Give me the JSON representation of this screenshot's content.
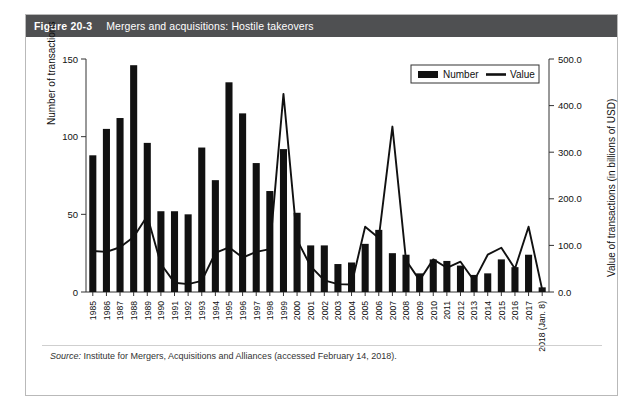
{
  "figure": {
    "number": "Figure 20-3",
    "title": "Mergers and acquisitions: Hostile takeovers"
  },
  "source": {
    "label": "Source:",
    "text": " Institute for Mergers, Acquisitions and Alliances (accessed February 14, 2018)."
  },
  "colors": {
    "title_bar_bg": "#4f5052",
    "title_bar_text": "#ffffff",
    "bar_fill": "#111111",
    "line_stroke": "#111111",
    "card_border": "#b9b9b9",
    "axis": "#333333"
  },
  "chart_data": {
    "type": "bar",
    "title": "Mergers and acquisitions: Hostile takeovers",
    "xlabel": "",
    "ylabel": "Number of transactions",
    "y2label": "Value of transactions (in billions of USD)",
    "ylim": [
      0,
      150
    ],
    "y2lim": [
      0,
      500
    ],
    "yticks": [
      0,
      50,
      100,
      150
    ],
    "y2ticks": [
      "0.0",
      "100.0",
      "200.0",
      "300.0",
      "400.0",
      "500.0"
    ],
    "grid": false,
    "legend_position": "top-right",
    "legend": [
      "Number",
      "Value"
    ],
    "categories": [
      "1985",
      "1986",
      "1987",
      "1988",
      "1989",
      "1990",
      "1991",
      "1992",
      "1993",
      "1994",
      "1995",
      "1996",
      "1997",
      "1998",
      "1999",
      "2000",
      "2001",
      "2002",
      "2003",
      "2004",
      "2005",
      "2006",
      "2007",
      "2008",
      "2009",
      "2010",
      "2011",
      "2012",
      "2013",
      "2014",
      "2015",
      "2016",
      "2017",
      "2018 (Jan. 8)"
    ],
    "series": [
      {
        "name": "Number",
        "type": "bar",
        "axis": "left",
        "values": [
          88,
          105,
          112,
          146,
          96,
          52,
          52,
          50,
          93,
          72,
          135,
          115,
          83,
          65,
          92,
          51,
          30,
          30,
          18,
          19,
          31,
          40,
          25,
          24,
          12,
          21,
          20,
          17,
          11,
          12,
          21,
          16,
          24,
          3
        ]
      },
      {
        "name": "Value",
        "type": "line",
        "axis": "right",
        "values": [
          88,
          86,
          96,
          118,
          163,
          60,
          20,
          17,
          24,
          84,
          96,
          74,
          86,
          92,
          425,
          112,
          55,
          25,
          17,
          16,
          140,
          116,
          355,
          68,
          25,
          70,
          52,
          65,
          24,
          80,
          95,
          50,
          140,
          5
        ]
      }
    ]
  }
}
